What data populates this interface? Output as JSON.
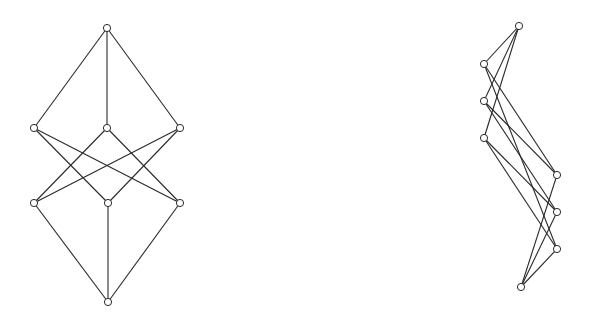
{
  "diagram": {
    "background": "#ffffff",
    "line_color": "#2a2a2a",
    "node_radius": 3.6,
    "graphs": [
      {
        "name": "left-graph",
        "nodes": [
          {
            "id": "top",
            "x": 107,
            "y": 28
          },
          {
            "id": "L1",
            "x": 34,
            "y": 128
          },
          {
            "id": "M1",
            "x": 107,
            "y": 128
          },
          {
            "id": "R1",
            "x": 180,
            "y": 128
          },
          {
            "id": "L2",
            "x": 34,
            "y": 203
          },
          {
            "id": "M2",
            "x": 108,
            "y": 203
          },
          {
            "id": "R2",
            "x": 180,
            "y": 203
          },
          {
            "id": "bottom",
            "x": 108,
            "y": 302
          }
        ],
        "edges": [
          [
            "top",
            "L1"
          ],
          [
            "top",
            "M1"
          ],
          [
            "top",
            "R1"
          ],
          [
            "L1",
            "M2"
          ],
          [
            "L1",
            "R2"
          ],
          [
            "M1",
            "L2"
          ],
          [
            "M1",
            "R2"
          ],
          [
            "R1",
            "L2"
          ],
          [
            "R1",
            "M2"
          ],
          [
            "L2",
            "bottom"
          ],
          [
            "M2",
            "bottom"
          ],
          [
            "R2",
            "bottom"
          ]
        ]
      },
      {
        "name": "right-graph",
        "nodes": [
          {
            "id": "top",
            "x": 519,
            "y": 26
          },
          {
            "id": "L1",
            "x": 484,
            "y": 64
          },
          {
            "id": "L2",
            "x": 484,
            "y": 101
          },
          {
            "id": "L3",
            "x": 484,
            "y": 138
          },
          {
            "id": "R1",
            "x": 557,
            "y": 175
          },
          {
            "id": "R2",
            "x": 557,
            "y": 212
          },
          {
            "id": "R3",
            "x": 557,
            "y": 249
          },
          {
            "id": "bottom",
            "x": 521,
            "y": 287
          }
        ],
        "edges": [
          [
            "top",
            "L1"
          ],
          [
            "top",
            "L2"
          ],
          [
            "top",
            "L3"
          ],
          [
            "L1",
            "R1"
          ],
          [
            "L1",
            "R3"
          ],
          [
            "L2",
            "R1"
          ],
          [
            "L2",
            "R2"
          ],
          [
            "L3",
            "R2"
          ],
          [
            "L3",
            "R3"
          ],
          [
            "R1",
            "bottom"
          ],
          [
            "R2",
            "bottom"
          ],
          [
            "R3",
            "bottom"
          ]
        ]
      }
    ]
  }
}
